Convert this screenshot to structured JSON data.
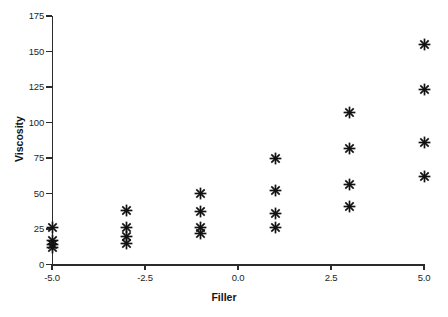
{
  "chart_data": {
    "type": "scatter",
    "title": "",
    "xlabel": "Filler",
    "ylabel": "Viscosity",
    "xlim": [
      -5.0,
      5.0
    ],
    "ylim": [
      0,
      175
    ],
    "grid": false,
    "legend": null,
    "marker": "asterisk",
    "marker_color": "#121212",
    "xticks": [
      -5.0,
      -2.5,
      0.0,
      2.5,
      5.0
    ],
    "xtick_labels": [
      "-5.0",
      "-2.5",
      "0.0",
      "2.5",
      "5.0"
    ],
    "yticks": [
      0,
      25,
      50,
      75,
      100,
      125,
      150,
      175
    ],
    "ytick_labels": [
      "0",
      "25",
      "50",
      "75",
      "100",
      "125",
      "150",
      "175"
    ],
    "points": [
      {
        "x": -5,
        "y": 26
      },
      {
        "x": -5,
        "y": 17
      },
      {
        "x": -5,
        "y": 14
      },
      {
        "x": -5,
        "y": 12
      },
      {
        "x": -3,
        "y": 38
      },
      {
        "x": -3,
        "y": 26
      },
      {
        "x": -3,
        "y": 20
      },
      {
        "x": -3,
        "y": 15
      },
      {
        "x": -1,
        "y": 50
      },
      {
        "x": -1,
        "y": 37
      },
      {
        "x": -1,
        "y": 26
      },
      {
        "x": -1,
        "y": 22
      },
      {
        "x": 1,
        "y": 75
      },
      {
        "x": 1,
        "y": 52
      },
      {
        "x": 1,
        "y": 36
      },
      {
        "x": 1,
        "y": 26
      },
      {
        "x": 3,
        "y": 107
      },
      {
        "x": 3,
        "y": 82
      },
      {
        "x": 3,
        "y": 56
      },
      {
        "x": 3,
        "y": 41
      },
      {
        "x": 5,
        "y": 155
      },
      {
        "x": 5,
        "y": 123
      },
      {
        "x": 5,
        "y": 86
      },
      {
        "x": 5,
        "y": 62
      }
    ]
  }
}
